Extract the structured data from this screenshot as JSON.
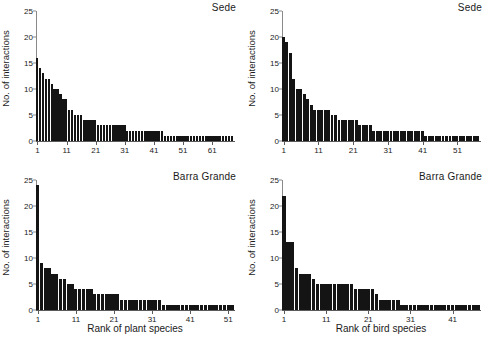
{
  "figure": {
    "ylabel": "No. of interactions",
    "y_ticks": [
      0,
      5,
      10,
      15,
      20,
      25
    ],
    "ylim": [
      0,
      25
    ]
  },
  "chart_data": [
    {
      "type": "bar",
      "panel": "top-left",
      "title": "Sede",
      "xlabel": "",
      "ylabel": "No. of interactions",
      "ylim": [
        0,
        25
      ],
      "y_ticks": [
        0,
        5,
        10,
        15,
        20,
        25
      ],
      "x_ticks": [
        1,
        11,
        21,
        31,
        41,
        51,
        61
      ],
      "xlim": [
        1,
        68
      ],
      "grid": false,
      "legend": "none",
      "categories": [
        1,
        2,
        3,
        4,
        5,
        6,
        7,
        8,
        9,
        10,
        11,
        12,
        13,
        14,
        15,
        16,
        17,
        18,
        19,
        20,
        21,
        22,
        23,
        24,
        25,
        26,
        27,
        28,
        29,
        30,
        31,
        32,
        33,
        34,
        35,
        36,
        37,
        38,
        39,
        40,
        41,
        42,
        43,
        44,
        45,
        46,
        47,
        48,
        49,
        50,
        51,
        52,
        53,
        54,
        55,
        56,
        57,
        58,
        59,
        60,
        61,
        62,
        63,
        64,
        65,
        66,
        67,
        68
      ],
      "values": [
        16,
        14,
        13,
        12,
        12,
        11,
        10,
        10,
        9,
        8,
        8,
        6,
        6,
        5,
        5,
        5,
        4,
        4,
        4,
        4,
        4,
        3,
        3,
        3,
        3,
        3,
        3,
        3,
        3,
        3,
        3,
        2,
        2,
        2,
        2,
        2,
        2,
        2,
        2,
        2,
        2,
        2,
        2,
        2,
        1,
        1,
        1,
        1,
        1,
        1,
        1,
        1,
        1,
        1,
        1,
        1,
        1,
        1,
        1,
        1,
        1,
        1,
        1,
        1,
        1,
        1,
        1,
        1
      ]
    },
    {
      "type": "bar",
      "panel": "top-right",
      "title": "Sede",
      "xlabel": "",
      "ylabel": "No. of interactions",
      "ylim": [
        0,
        25
      ],
      "y_ticks": [
        0,
        5,
        10,
        15,
        20,
        25
      ],
      "x_ticks": [
        1,
        11,
        21,
        31,
        41,
        51
      ],
      "xlim": [
        1,
        57
      ],
      "grid": false,
      "legend": "none",
      "categories": [
        1,
        2,
        3,
        4,
        5,
        6,
        7,
        8,
        9,
        10,
        11,
        12,
        13,
        14,
        15,
        16,
        17,
        18,
        19,
        20,
        21,
        22,
        23,
        24,
        25,
        26,
        27,
        28,
        29,
        30,
        31,
        32,
        33,
        34,
        35,
        36,
        37,
        38,
        39,
        40,
        41,
        42,
        43,
        44,
        45,
        46,
        47,
        48,
        49,
        50,
        51,
        52,
        53,
        54,
        55,
        56,
        57
      ],
      "values": [
        20,
        19,
        17,
        12,
        10,
        10,
        9,
        8,
        7,
        6,
        6,
        6,
        6,
        6,
        5,
        5,
        4,
        4,
        4,
        4,
        4,
        4,
        3,
        3,
        3,
        3,
        2,
        2,
        2,
        2,
        2,
        2,
        2,
        2,
        2,
        2,
        2,
        2,
        2,
        2,
        2,
        1,
        1,
        1,
        1,
        1,
        1,
        1,
        1,
        1,
        1,
        1,
        1,
        1,
        1,
        1,
        1
      ]
    },
    {
      "type": "bar",
      "panel": "bottom-left",
      "title": "Barra Grande",
      "xlabel": "Rank of plant species",
      "ylabel": "No. of interactions",
      "ylim": [
        0,
        25
      ],
      "y_ticks": [
        0,
        5,
        10,
        15,
        20,
        25
      ],
      "x_ticks": [
        1,
        11,
        21,
        31,
        41,
        51
      ],
      "xlim": [
        1,
        52
      ],
      "grid": false,
      "legend": "none",
      "categories": [
        1,
        2,
        3,
        4,
        5,
        6,
        7,
        8,
        9,
        10,
        11,
        12,
        13,
        14,
        15,
        16,
        17,
        18,
        19,
        20,
        21,
        22,
        23,
        24,
        25,
        26,
        27,
        28,
        29,
        30,
        31,
        32,
        33,
        34,
        35,
        36,
        37,
        38,
        39,
        40,
        41,
        42,
        43,
        44,
        45,
        46,
        47,
        48,
        49,
        50,
        51,
        52
      ],
      "values": [
        24,
        9,
        8,
        8,
        7,
        7,
        6,
        6,
        5,
        5,
        4,
        4,
        4,
        4,
        4,
        3,
        3,
        3,
        3,
        3,
        3,
        3,
        2,
        2,
        2,
        2,
        2,
        2,
        2,
        2,
        2,
        2,
        2,
        1,
        1,
        1,
        1,
        1,
        1,
        1,
        1,
        1,
        1,
        1,
        1,
        1,
        1,
        1,
        1,
        1,
        1,
        1
      ]
    },
    {
      "type": "bar",
      "panel": "bottom-right",
      "title": "Barra Grande",
      "xlabel": "Rank of bird species",
      "ylabel": "No. of interactions",
      "ylim": [
        0,
        25
      ],
      "y_ticks": [
        0,
        5,
        10,
        15,
        20,
        25
      ],
      "x_ticks": [
        1,
        11,
        21,
        31,
        41
      ],
      "xlim": [
        1,
        47
      ],
      "grid": false,
      "legend": "none",
      "categories": [
        1,
        2,
        3,
        4,
        5,
        6,
        7,
        8,
        9,
        10,
        11,
        12,
        13,
        14,
        15,
        16,
        17,
        18,
        19,
        20,
        21,
        22,
        23,
        24,
        25,
        26,
        27,
        28,
        29,
        30,
        31,
        32,
        33,
        34,
        35,
        36,
        37,
        38,
        39,
        40,
        41,
        42,
        43,
        44,
        45,
        46,
        47
      ],
      "values": [
        22,
        13,
        13,
        8,
        7,
        7,
        7,
        6,
        5,
        5,
        5,
        5,
        5,
        5,
        5,
        5,
        5,
        4,
        4,
        4,
        4,
        4,
        3,
        2,
        2,
        2,
        2,
        2,
        1,
        1,
        1,
        1,
        1,
        1,
        1,
        1,
        1,
        1,
        1,
        1,
        1,
        1,
        1,
        1,
        1,
        1,
        1
      ]
    }
  ]
}
